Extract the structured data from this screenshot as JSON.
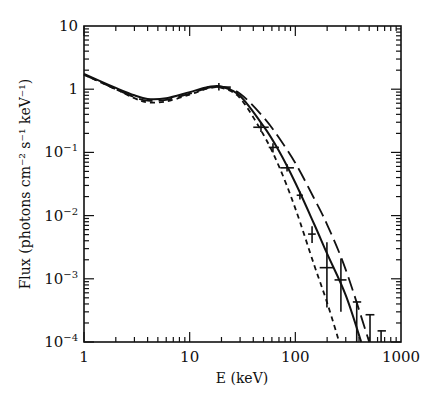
{
  "chart_data": {
    "type": "line",
    "title": "",
    "xlabel": "E (keV)",
    "ylabel": "Flux (photons cm⁻² s⁻¹ keV⁻¹)",
    "xscale": "log",
    "yscale": "log",
    "xlim": [
      1,
      1000
    ],
    "ylim": [
      0.0001,
      10
    ],
    "x_ticks": [
      "1",
      "10",
      "100",
      "1000"
    ],
    "y_ticks": [
      "10",
      "1",
      "10⁻¹",
      "10⁻²",
      "10⁻³",
      "10⁻⁴"
    ],
    "grid": false,
    "legend": null,
    "series": [
      {
        "name": "model-solid",
        "style": "solid",
        "x": [
          1,
          2,
          3,
          4,
          6,
          10,
          15,
          20,
          30,
          50,
          70,
          100,
          150,
          200,
          300,
          420
        ],
        "y": [
          1.75,
          1.05,
          0.8,
          0.7,
          0.72,
          0.9,
          1.08,
          1.1,
          0.78,
          0.26,
          0.105,
          0.033,
          0.0075,
          0.0025,
          0.00055,
          0.0001
        ]
      },
      {
        "name": "model-long-dash",
        "style": "long-dash",
        "x": [
          1,
          2,
          3,
          4,
          6,
          10,
          15,
          20,
          30,
          50,
          70,
          100,
          150,
          200,
          300,
          500
        ],
        "y": [
          1.7,
          1.0,
          0.75,
          0.66,
          0.68,
          0.85,
          1.05,
          1.1,
          0.85,
          0.36,
          0.17,
          0.068,
          0.019,
          0.0072,
          0.0014,
          0.0001
        ]
      },
      {
        "name": "model-short-dash",
        "style": "short-dash",
        "x": [
          1,
          2,
          3,
          4,
          6,
          10,
          15,
          20,
          30,
          50,
          70,
          100,
          150,
          200,
          260
        ],
        "y": [
          1.7,
          1.0,
          0.72,
          0.62,
          0.64,
          0.82,
          1.03,
          1.05,
          0.72,
          0.19,
          0.06,
          0.013,
          0.0017,
          0.00042,
          0.0001
        ]
      }
    ],
    "data_points": [
      {
        "E": 18.9,
        "flux": 1.08,
        "E_err": [
          14.5,
          24.5
        ],
        "flux_err": [
          0.95,
          1.25
        ],
        "upper_limit": false
      },
      {
        "E": 47.3,
        "flux": 0.25,
        "E_err": [
          40,
          56
        ],
        "flux_err": [
          0.21,
          0.3
        ],
        "upper_limit": false
      },
      {
        "E": 61.4,
        "flux": 0.12,
        "E_err": [
          56,
          70
        ],
        "flux_err": [
          0.1,
          0.14
        ],
        "upper_limit": false
      },
      {
        "E": 83.5,
        "flux": 0.057,
        "E_err": [
          72,
          97
        ],
        "flux_err": [
          0.05,
          0.065
        ],
        "upper_limit": false
      },
      {
        "E": 110.5,
        "flux": 0.021,
        "E_err": [
          103,
          118
        ],
        "flux_err": [
          0.018,
          0.024
        ],
        "upper_limit": false
      },
      {
        "E": 144,
        "flux": 0.0051,
        "E_err": [
          132,
          156
        ],
        "flux_err": [
          0.0037,
          0.0068
        ],
        "upper_limit": false
      },
      {
        "E": 199,
        "flux": 0.0015,
        "E_err": [
          170,
          232
        ],
        "flux_err": [
          0.00035,
          0.0038
        ],
        "upper_limit": false
      },
      {
        "E": 270,
        "flux": 0.00096,
        "E_err": [
          235,
          305
        ],
        "flux_err": [
          0.0003,
          0.0021
        ],
        "upper_limit": false
      },
      {
        "E": 381,
        "flux": 0.00043,
        "E_err": [
          350,
          420
        ],
        "flux_err": [
          0.0001,
          0.00043
        ],
        "upper_limit": true
      },
      {
        "E": 509,
        "flux": 0.00027,
        "E_err": [
          462,
          560
        ],
        "flux_err": [
          0.0001,
          0.00027
        ],
        "upper_limit": true
      },
      {
        "E": 648,
        "flux": 0.00015,
        "E_err": [
          600,
          720
        ],
        "flux_err": [
          0.0001,
          0.00015
        ],
        "upper_limit": true
      }
    ]
  },
  "axes": {
    "x_label": "E (keV)",
    "y_label": "Flux (photons cm⁻² s⁻¹ keV⁻¹)",
    "x_tick_labels": [
      "1",
      "10",
      "100",
      "1000"
    ],
    "y_tick_labels": [
      {
        "base": "10",
        "exp": ""
      },
      {
        "base": "1",
        "exp": ""
      },
      {
        "base": "10",
        "exp": "−1"
      },
      {
        "base": "10",
        "exp": "−2"
      },
      {
        "base": "10",
        "exp": "−3"
      },
      {
        "base": "10",
        "exp": "−4"
      }
    ]
  },
  "colors": {
    "ink": "#111111",
    "background": "#ffffff"
  }
}
